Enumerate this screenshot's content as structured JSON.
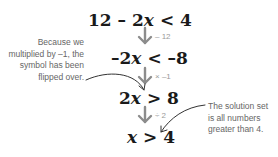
{
  "equations": [
    {
      "id": "eq1",
      "parts": [
        "12 – 2",
        "x",
        " < 4"
      ]
    },
    {
      "id": "eq2",
      "parts": [
        "–2",
        "x",
        " < –8"
      ]
    },
    {
      "id": "eq3",
      "parts": [
        "2",
        "x",
        " > 8"
      ]
    },
    {
      "id": "eq4",
      "parts": [
        "",
        "x",
        " > 4"
      ]
    }
  ],
  "steps": [
    {
      "label": "– 12"
    },
    {
      "label": "× –1"
    },
    {
      "label": "÷ 2"
    }
  ],
  "notes": {
    "left": "Because we multiplied by –1, the symbol has been flipped over.",
    "right": "The solution set is all numbers greater than 4."
  },
  "colors": {
    "equation": "#1a1a1a",
    "arrow": "#8c8c8c",
    "annotation": "#666666",
    "pointer": "#333333"
  }
}
